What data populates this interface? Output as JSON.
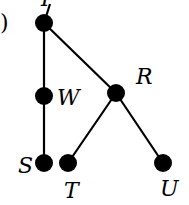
{
  "diagram": {
    "type": "tree",
    "fragment_label": ")",
    "nodes": [
      {
        "id": "Y",
        "label": "Y",
        "x": 44,
        "y": 23
      },
      {
        "id": "W",
        "label": "W",
        "x": 44,
        "y": 96
      },
      {
        "id": "S",
        "label": "S",
        "x": 44,
        "y": 163
      },
      {
        "id": "R",
        "label": "R",
        "x": 116,
        "y": 93
      },
      {
        "id": "T",
        "label": "T",
        "x": 68,
        "y": 163
      },
      {
        "id": "U",
        "label": "U",
        "x": 163,
        "y": 163
      }
    ],
    "edges": [
      [
        "Y",
        "W"
      ],
      [
        "W",
        "S"
      ],
      [
        "Y",
        "R"
      ],
      [
        "R",
        "T"
      ],
      [
        "R",
        "U"
      ]
    ],
    "colors": {
      "node": "#000000",
      "edge": "#000000",
      "background": "#ffffff"
    }
  }
}
